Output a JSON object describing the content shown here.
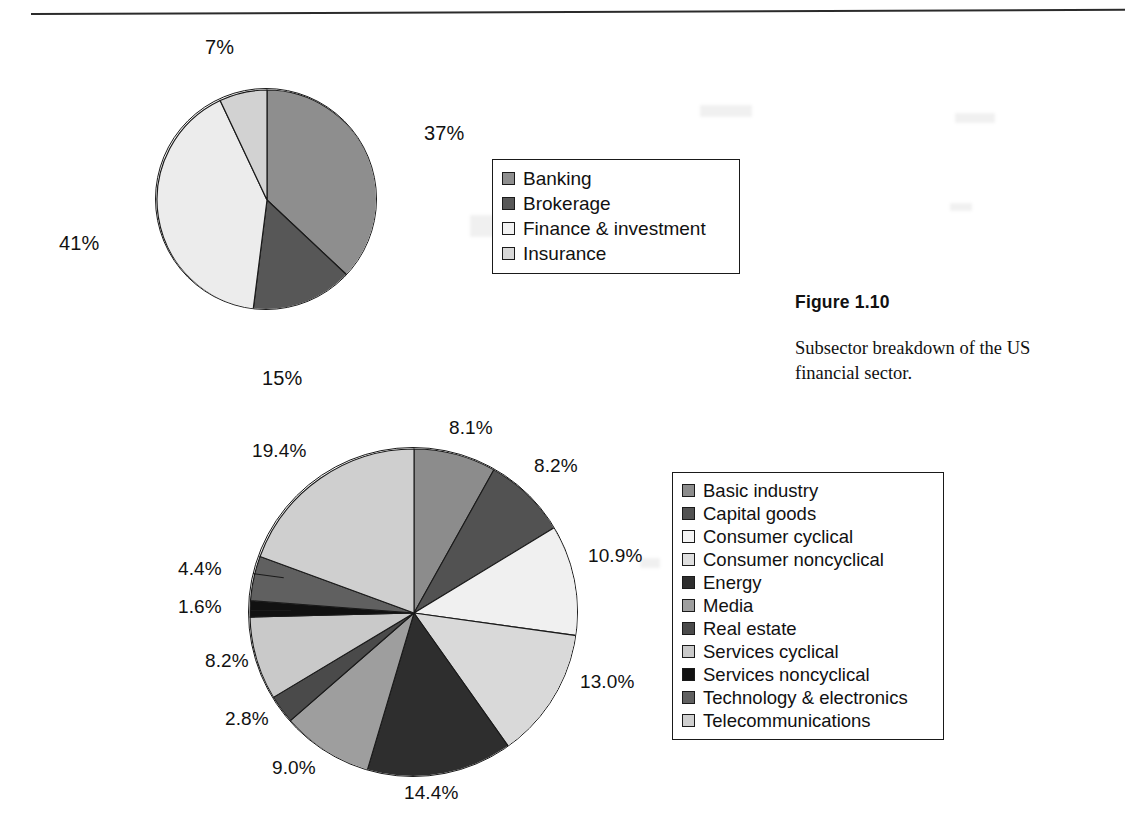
{
  "figure": {
    "number_label": "Figure 1.10",
    "caption": "Subsector breakdown of the US financial sector."
  },
  "chart_data": [
    {
      "type": "pie",
      "id": "us-financial-subsectors",
      "title": "",
      "start_angle_deg": 0,
      "direction": "clockwise",
      "value_suffix": "%",
      "legend_position": "right",
      "categories": [
        "Banking",
        "Brokerage",
        "Finance & investment",
        "Insurance"
      ],
      "values": [
        37,
        15,
        41,
        7
      ],
      "labels": [
        "37%",
        "15%",
        "41%",
        "7%"
      ],
      "colors": [
        "#8e8e8e",
        "#575757",
        "#ececec",
        "#d2d2d2"
      ],
      "legend": [
        {
          "label": "Banking",
          "color": "#8e8e8e"
        },
        {
          "label": "Brokerage",
          "color": "#575757"
        },
        {
          "label": "Finance & investment",
          "color": "#f2f2f2"
        },
        {
          "label": "Insurance",
          "color": "#d8d8d8"
        }
      ]
    },
    {
      "type": "pie",
      "id": "us-corporate-sectors",
      "title": "",
      "start_angle_deg": 0,
      "direction": "clockwise",
      "value_suffix": "%",
      "legend_position": "right",
      "categories": [
        "Basic industry",
        "Capital goods",
        "Consumer cyclical",
        "Consumer noncyclical",
        "Energy",
        "Media",
        "Real estate",
        "Services cyclical",
        "Services noncyclical",
        "Technology & electronics",
        "Telecommunications"
      ],
      "values": [
        8.1,
        8.2,
        10.9,
        13.0,
        14.4,
        9.0,
        2.8,
        8.2,
        1.6,
        4.4,
        19.4
      ],
      "labels": [
        "8.1%",
        "8.2%",
        "10.9%",
        "13.0%",
        "14.4%",
        "9.0%",
        "2.8%",
        "8.2%",
        "1.6%",
        "4.4%",
        "19.4%"
      ],
      "colors": [
        "#8c8c8c",
        "#525252",
        "#f0f0f0",
        "#d9d9d9",
        "#2e2e2e",
        "#9e9e9e",
        "#4a4a4a",
        "#c9c9c9",
        "#111111",
        "#606060",
        "#cfcfcf"
      ],
      "legend": [
        {
          "label": "Basic industry",
          "color": "#8c8c8c"
        },
        {
          "label": "Capital goods",
          "color": "#525252"
        },
        {
          "label": "Consumer cyclical",
          "color": "#f4f4f4"
        },
        {
          "label": "Consumer noncyclical",
          "color": "#dedede"
        },
        {
          "label": "Energy",
          "color": "#2e2e2e"
        },
        {
          "label": "Media",
          "color": "#9e9e9e"
        },
        {
          "label": "Real estate",
          "color": "#4a4a4a"
        },
        {
          "label": "Services cyclical",
          "color": "#c9c9c9"
        },
        {
          "label": "Services noncyclical",
          "color": "#111111"
        },
        {
          "label": "Technology & electronics",
          "color": "#606060"
        },
        {
          "label": "Telecommunications",
          "color": "#cfcfcf"
        }
      ]
    }
  ]
}
